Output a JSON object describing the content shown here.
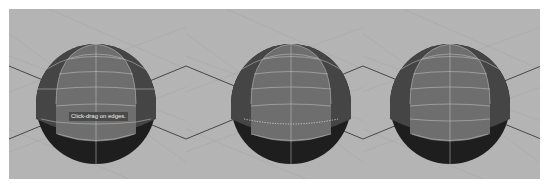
{
  "figure": {
    "panels": [
      {
        "id": "panel-1",
        "description": "Polygon sphere with insert edge loop tool active",
        "tooltip": "Click-drag on edges.",
        "state": "tool-active"
      },
      {
        "id": "panel-2",
        "description": "Dotted edge loop preview while dragging",
        "tooltip": "",
        "state": "dragging-preview"
      },
      {
        "id": "panel-3",
        "description": "Edge loop inserted",
        "tooltip": "",
        "state": "loop-inserted"
      }
    ],
    "colors": {
      "viewport_bg": "#b4b4b4",
      "grid_line": "#a6a6a6",
      "axis_line": "#3a3a3a",
      "sphere_front": "#6e6e6e",
      "sphere_side": "#454545",
      "sphere_bottom": "#1e1e1e",
      "wire": "#c8c8c8",
      "preview_dots": "#d8d8d8"
    }
  }
}
